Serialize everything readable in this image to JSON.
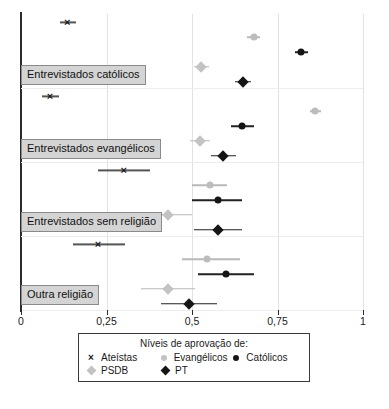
{
  "chart_data": {
    "type": "scatter",
    "title": "",
    "subtitle": "",
    "xlabel": "",
    "ylabel": "",
    "xlim": [
      0,
      1
    ],
    "xticks": [
      0,
      0.25,
      0.5,
      0.75,
      1
    ],
    "xticklabels": [
      "0",
      "0,25",
      "0,5",
      "0,75",
      "1"
    ],
    "grid": true,
    "orientation": "horizontal",
    "legend_position": "below-axis",
    "legend_title": "Níveis de aprovação de:",
    "series": [
      {
        "name": "Ateístas",
        "marker": "x",
        "color": "#1b1b1b"
      },
      {
        "name": "Evangélicos",
        "marker": "circle",
        "color": "#bdbdbd"
      },
      {
        "name": "Católicos",
        "marker": "circle",
        "color": "#151515"
      },
      {
        "name": "PSDB",
        "marker": "diamond",
        "color": "#c3c3c3"
      },
      {
        "name": "PT",
        "marker": "diamond",
        "color": "#151515"
      }
    ],
    "groups": [
      {
        "label": "Entrevistados católicos",
        "points": [
          {
            "series": "Ateístas",
            "value": 0.135,
            "ci_low": 0.115,
            "ci_high": 0.16
          },
          {
            "series": "Evangélicos",
            "value": 0.68,
            "ci_low": 0.66,
            "ci_high": 0.7
          },
          {
            "series": "Católicos",
            "value": 0.82,
            "ci_low": 0.8,
            "ci_high": 0.84
          },
          {
            "series": "PSDB",
            "value": 0.525,
            "ci_low": 0.505,
            "ci_high": 0.55
          },
          {
            "series": "PT",
            "value": 0.65,
            "ci_low": 0.625,
            "ci_high": 0.672
          }
        ]
      },
      {
        "label": "Entrevistados evangélicos",
        "points": [
          {
            "series": "Ateístas",
            "value": 0.085,
            "ci_low": 0.06,
            "ci_high": 0.112
          },
          {
            "series": "Evangélicos",
            "value": 0.86,
            "ci_low": 0.845,
            "ci_high": 0.878
          },
          {
            "series": "Católicos",
            "value": 0.645,
            "ci_low": 0.615,
            "ci_high": 0.68
          },
          {
            "series": "PSDB",
            "value": 0.522,
            "ci_low": 0.495,
            "ci_high": 0.552
          },
          {
            "series": "PT",
            "value": 0.592,
            "ci_low": 0.555,
            "ci_high": 0.628
          }
        ]
      },
      {
        "label": "Entrevistados sem religião",
        "points": [
          {
            "series": "Ateístas",
            "value": 0.3,
            "ci_low": 0.225,
            "ci_high": 0.378
          },
          {
            "series": "Evangélicos",
            "value": 0.552,
            "ci_low": 0.5,
            "ci_high": 0.603
          },
          {
            "series": "Católicos",
            "value": 0.575,
            "ci_low": 0.5,
            "ci_high": 0.645
          },
          {
            "series": "PSDB",
            "value": 0.43,
            "ci_low": 0.358,
            "ci_high": 0.5
          },
          {
            "series": "PT",
            "value": 0.575,
            "ci_low": 0.505,
            "ci_high": 0.645
          }
        ]
      },
      {
        "label": "Outra religião",
        "points": [
          {
            "series": "Ateístas",
            "value": 0.225,
            "ci_low": 0.152,
            "ci_high": 0.305
          },
          {
            "series": "Evangélicos",
            "value": 0.545,
            "ci_low": 0.472,
            "ci_high": 0.64
          },
          {
            "series": "Católicos",
            "value": 0.6,
            "ci_low": 0.518,
            "ci_high": 0.68
          },
          {
            "series": "PSDB",
            "value": 0.43,
            "ci_low": 0.352,
            "ci_high": 0.508
          },
          {
            "series": "PT",
            "value": 0.49,
            "ci_low": 0.408,
            "ci_high": 0.573
          }
        ]
      }
    ]
  },
  "legend": {
    "title": "Níveis de aprovação de:",
    "rows": [
      [
        {
          "label": "Ateístas",
          "marker": "x",
          "tone": "dark"
        },
        {
          "label": "Evangélicos",
          "marker": "circle",
          "tone": "light"
        },
        {
          "label": "Católicos",
          "marker": "circle",
          "tone": "dark"
        }
      ],
      [
        {
          "label": "PSDB",
          "marker": "diamond",
          "tone": "light"
        },
        {
          "label": "PT",
          "marker": "diamond",
          "tone": "dark"
        }
      ]
    ]
  },
  "axis": {
    "ticklabels": [
      "0",
      "0,25",
      "0,5",
      "0,75",
      "1"
    ],
    "tickvalues": [
      0,
      0.25,
      0.5,
      0.75,
      1
    ]
  },
  "colors": {
    "dark": "#151515",
    "light": "#c3c3c3",
    "grid": "#e2e2e2",
    "axis": "#2b2b2b",
    "label_bg": "#d4d4d4",
    "label_border": "#8a8a8a"
  }
}
